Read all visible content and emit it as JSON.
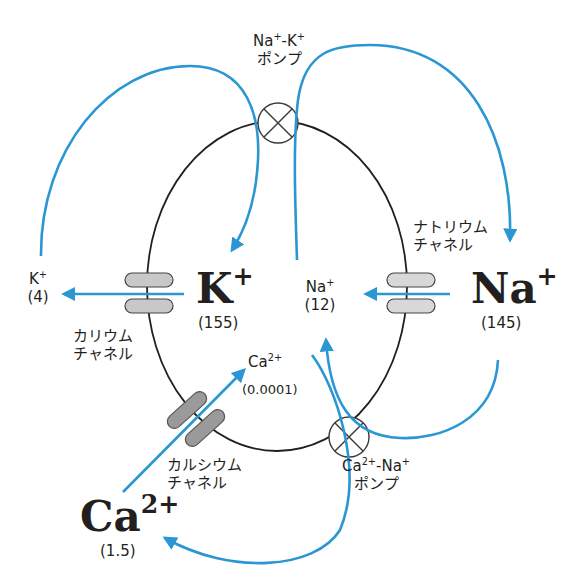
{
  "colors": {
    "flow": "#2a96d4",
    "membrane": "#231f20",
    "channel_light": "#d4d4d4",
    "channel_dark": "#9a9a9a"
  },
  "pumps": {
    "na_k": {
      "line1": "Na⁺-K⁺",
      "line2": "ポンプ"
    },
    "ca_na": {
      "line1": "Ca²⁺-Na⁺",
      "line2": "ポンプ"
    }
  },
  "channels": {
    "potassium": {
      "line1": "カリウム",
      "line2": "チャネル"
    },
    "sodium": {
      "line1": "ナトリウム",
      "line2": "チャネル"
    },
    "calcium": {
      "line1": "カルシウム",
      "line2": "チャネル"
    }
  },
  "ions": {
    "k_out": {
      "symbol": "K",
      "charge": "+",
      "conc": "(4)"
    },
    "k_in": {
      "symbol": "K",
      "charge": "+",
      "conc": "(155)"
    },
    "na_in": {
      "symbol": "Na",
      "charge": "+",
      "conc": "(12)"
    },
    "na_out": {
      "symbol": "Na",
      "charge": "+",
      "conc": "(145)"
    },
    "ca_in": {
      "symbol": "Ca",
      "charge": "2+",
      "conc": "(0.0001)"
    },
    "ca_out": {
      "symbol": "Ca",
      "charge": "2+",
      "conc": "(1.5)"
    }
  }
}
